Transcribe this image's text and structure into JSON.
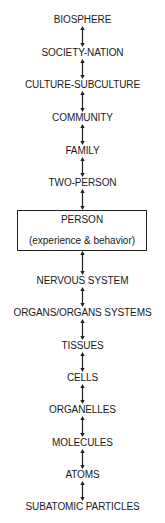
{
  "diagram": {
    "type": "hierarchy-of-systems",
    "levels": [
      {
        "label": "BIOSPHERE",
        "y": 14
      },
      {
        "label": "SOCIETY-NATION",
        "y": 47
      },
      {
        "label": "CULTURE-SUBCULTURE",
        "y": 79
      },
      {
        "label": "COMMUNITY",
        "y": 112
      },
      {
        "label": "FAMILY",
        "y": 145
      },
      {
        "label": "TWO-PERSON",
        "y": 177
      }
    ],
    "focus": {
      "title": "PERSON",
      "subtitle": "(experience & behavior)"
    },
    "lower_levels": [
      {
        "label": "NERVOUS SYSTEM",
        "y": 275
      },
      {
        "label": "ORGANS/ORGANS SYSTEMS",
        "y": 307
      },
      {
        "label": "TISSUES",
        "y": 340
      },
      {
        "label": "CELLS",
        "y": 372
      },
      {
        "label": "ORGANELLES",
        "y": 404
      },
      {
        "label": "MOLECULES",
        "y": 437
      },
      {
        "label": "ATOMS",
        "y": 469
      },
      {
        "label": "SUBATOMIC PARTICLES",
        "y": 501
      }
    ],
    "connector": "double-headed-arrow"
  }
}
